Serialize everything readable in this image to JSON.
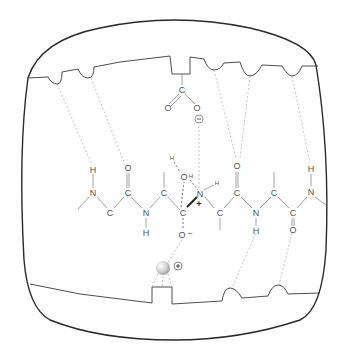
{
  "diagram": {
    "title": "",
    "colors": {
      "frame": "#2a2a2a",
      "surface": "#3a3a3a",
      "bond": "#8a8a8a",
      "hydrogen_bond": "#b4b4b4",
      "atom_label": "#555555",
      "metal_ion": "#cfcfcf"
    },
    "carboxylate": {
      "carbon": "C",
      "oxygen_left": "O",
      "oxygen_right": "O",
      "charge": "−"
    },
    "chain_atoms": {
      "h1": "H",
      "n1": "N",
      "c1": "C",
      "o1": "O",
      "c2": "C",
      "n2": "N",
      "h2": "H",
      "c3": "C",
      "water_h": "H",
      "water_o": "O",
      "water_h2": "H",
      "n3": "N",
      "n3_h": "H",
      "n3_charge": "+",
      "c4": "C",
      "o_minus": "O",
      "o_minus_charge": "−",
      "c5": "C",
      "o2": "O",
      "c6": "C",
      "n4": "N",
      "h3": "H",
      "c7": "C",
      "c8": "C",
      "o3": "O",
      "n5": "N",
      "h4": "H"
    },
    "metal_ion": {
      "charge": "+"
    }
  }
}
